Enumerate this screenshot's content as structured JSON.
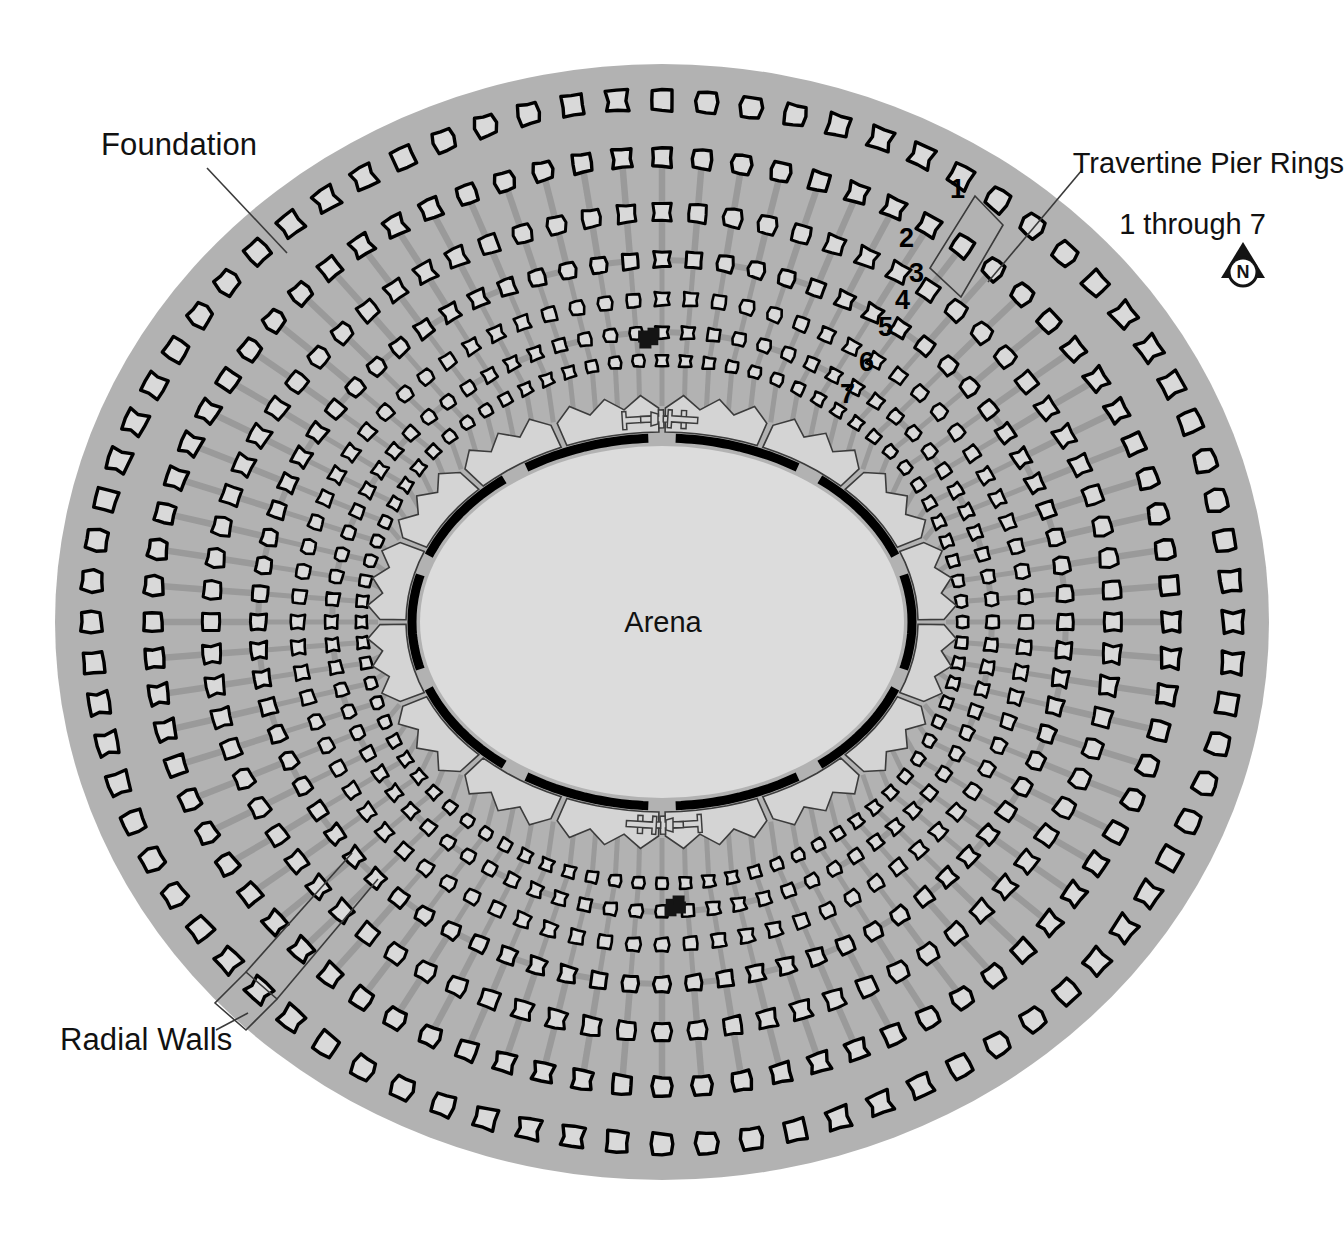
{
  "labels": {
    "foundation": "Foundation",
    "radial_walls": "Radial Walls",
    "travertine_line1": "Travertine Pier Rings",
    "travertine_line2": "1 through 7",
    "arena": "Arena"
  },
  "ring_numbers": [
    {
      "n": "1",
      "x": 950,
      "y": 174
    },
    {
      "n": "2",
      "x": 899,
      "y": 223
    },
    {
      "n": "3",
      "x": 909,
      "y": 258
    },
    {
      "n": "4",
      "x": 895,
      "y": 285
    },
    {
      "n": "5",
      "x": 878,
      "y": 312
    },
    {
      "n": "6",
      "x": 859,
      "y": 347
    },
    {
      "n": "7",
      "x": 840,
      "y": 379
    }
  ],
  "compass": {
    "label": "N",
    "name": "north-arrow",
    "x": 1243,
    "y": 272
  },
  "colors": {
    "background": "#ffffff",
    "foundation_fill": "#b2b2b2",
    "arena_fill": "#dcdcdc",
    "pier_fill": "#d9d9d9",
    "pier_stroke": "#000000",
    "radial_wall": "#9a9a9a",
    "substructure_fill": "#d4d4d4",
    "substructure_stroke": "#3c3c3c",
    "arena_boundary": "#000000",
    "gate_marker": "#141414",
    "leader_line": "#3a3a3a",
    "text": "#111111"
  },
  "chart_data": {
    "type": "diagram",
    "geometry": {
      "foundation_ellipse": {
        "cx": 662,
        "cy": 622,
        "rx": 607,
        "ry": 558
      },
      "arena_ellipse": {
        "cx": 662,
        "cy": 622,
        "rx": 242,
        "ry": 176
      },
      "arena_boundary_rx": 250,
      "arena_boundary_ry": 184
    },
    "pier_rings": [
      {
        "ring": 1,
        "rx": 571,
        "ry": 522,
        "count": 80,
        "pier_size": 20,
        "has_radial_wall": false
      },
      {
        "ring": 2,
        "rx": 510,
        "ry": 464,
        "count": 80,
        "pier_size": 18,
        "has_radial_wall": false
      },
      {
        "ring": 3,
        "rx": 452,
        "ry": 409,
        "count": 80,
        "pier_size": 17,
        "has_radial_wall": true
      },
      {
        "ring": 4,
        "rx": 404,
        "ry": 362,
        "count": 80,
        "pier_size": 15,
        "has_radial_wall": true
      },
      {
        "ring": 5,
        "rx": 364,
        "ry": 323,
        "count": 80,
        "pier_size": 13,
        "has_radial_wall": true
      },
      {
        "ring": 6,
        "rx": 330,
        "ry": 290,
        "count": 80,
        "pier_size": 12,
        "has_radial_wall": true
      },
      {
        "ring": 7,
        "rx": 300,
        "ry": 262,
        "count": 80,
        "pier_size": 11,
        "has_radial_wall": true
      }
    ],
    "gate_markers": {
      "count": 8,
      "note": "solid black squares on N and S axes"
    },
    "labels": [
      "Foundation",
      "Radial Walls",
      "Travertine Pier Rings 1 through 7",
      "Arena"
    ]
  }
}
